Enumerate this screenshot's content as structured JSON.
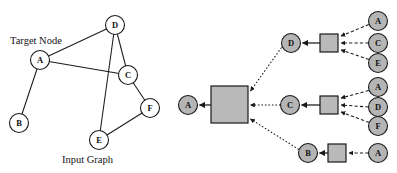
{
  "figure": {
    "colors": {
      "node_fill_open": "#ffffff",
      "node_fill_shaded": "#b5b5b5",
      "box_fill": "#b9b9b9",
      "stroke": "#1a1a1a",
      "background": "#ffffff"
    },
    "labels": {
      "target_node": "Target Node",
      "input_graph": "Input Graph"
    },
    "input_graph": {
      "nodes": [
        {
          "id": "A",
          "label": "A",
          "cx": 40,
          "cy": 60,
          "r": 9.5
        },
        {
          "id": "B",
          "label": "B",
          "cx": 19,
          "cy": 123,
          "r": 9.5
        },
        {
          "id": "C",
          "label": "C",
          "cx": 128,
          "cy": 75,
          "r": 9.5
        },
        {
          "id": "D",
          "label": "D",
          "cx": 115,
          "cy": 25,
          "r": 9.5
        },
        {
          "id": "E",
          "label": "E",
          "cx": 99,
          "cy": 140,
          "r": 9.5
        },
        {
          "id": "F",
          "label": "F",
          "cx": 150,
          "cy": 108,
          "r": 9.5
        }
      ],
      "edges": [
        {
          "from": "A",
          "to": "D"
        },
        {
          "from": "A",
          "to": "C"
        },
        {
          "from": "A",
          "to": "B"
        },
        {
          "from": "D",
          "to": "C"
        },
        {
          "from": "D",
          "to": "E"
        },
        {
          "from": "C",
          "to": "F"
        },
        {
          "from": "E",
          "to": "F"
        }
      ]
    },
    "computation_graph": {
      "output_node": {
        "label": "A",
        "cx": 188,
        "cy": 105,
        "r": 9.5
      },
      "root_box": {
        "x": 211,
        "y": 86,
        "w": 37,
        "h": 37
      },
      "layers": [
        {
          "id": "layer-d",
          "node": {
            "label": "D",
            "cx": 291,
            "cy": 43,
            "r": 9.5
          },
          "box": {
            "x": 320,
            "y": 34,
            "w": 18,
            "h": 18
          },
          "inputs": [
            {
              "label": "A",
              "cx": 378,
              "cy": 21,
              "r": 9.5
            },
            {
              "label": "C",
              "cx": 378,
              "cy": 43,
              "r": 9.5
            },
            {
              "label": "E",
              "cx": 378,
              "cy": 63,
              "r": 9.5
            }
          ]
        },
        {
          "id": "layer-c",
          "node": {
            "label": "C",
            "cx": 290,
            "cy": 105,
            "r": 9.5
          },
          "box": {
            "x": 320,
            "y": 96,
            "w": 18,
            "h": 18
          },
          "inputs": [
            {
              "label": "A",
              "cx": 378,
              "cy": 87,
              "r": 9.5
            },
            {
              "label": "D",
              "cx": 378,
              "cy": 107,
              "r": 9.5
            },
            {
              "label": "F",
              "cx": 378,
              "cy": 126,
              "r": 9.5
            }
          ]
        },
        {
          "id": "layer-b",
          "node": {
            "label": "B",
            "cx": 308,
            "cy": 153,
            "r": 9.5
          },
          "box": {
            "x": 328,
            "y": 144,
            "w": 18,
            "h": 18
          },
          "inputs": [
            {
              "label": "A",
              "cx": 378,
              "cy": 153,
              "r": 9.5
            }
          ]
        }
      ]
    }
  }
}
